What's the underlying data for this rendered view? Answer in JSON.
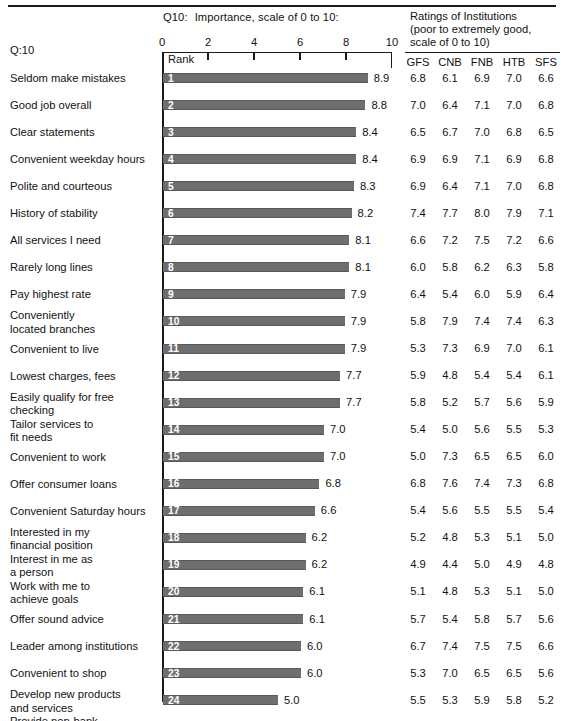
{
  "header": {
    "top_rule": true,
    "q10_prefix": "Q10:",
    "q10_title": "Importance, scale of 0 to 10:",
    "left_label": "Q:10",
    "ratings_line1": "Ratings of Institutions",
    "ratings_line2": "(poor to extremely good,",
    "ratings_line3": "scale of 0 to 10)",
    "rank_header": "Rank"
  },
  "axis": {
    "ticks": [
      0,
      2,
      4,
      6,
      8,
      10
    ],
    "tick_labels": [
      "0",
      "2",
      "4",
      "6",
      "8",
      "10"
    ],
    "min": 0,
    "max": 10
  },
  "ratings_columns": [
    "GFS",
    "CNB",
    "FNB",
    "HTB",
    "SFS"
  ],
  "chart_data": {
    "type": "bar",
    "xlabel": "",
    "ylabel": "",
    "xlim": [
      0,
      10
    ],
    "grid": false,
    "orientation": "horizontal",
    "categories": [
      "Seldom make mistakes",
      "Good job overall",
      "Clear statements",
      "Convenient weekday hours",
      "Polite and courteous",
      "History of stability",
      "All services I need",
      "Rarely long lines",
      "Pay highest rate",
      "Conveniently\n  located branches",
      "Convenient to live",
      "Lowest charges, fees",
      "Easily qualify for free\n  checking",
      "Tailor services to\n  fit needs",
      "Convenient to work",
      "Offer consumer loans",
      "Convenient Saturday hours",
      "Interested in my\n  financial position",
      "Interest in me as\n  a person",
      "Work with me to\n  achieve goals",
      "Offer sound advice",
      "Leader among institutions",
      "Convenient to shop",
      "Develop new products\n  and services",
      "Provide non-bank\n  financial services"
    ],
    "ranks": [
      1,
      2,
      3,
      4,
      5,
      6,
      7,
      8,
      9,
      10,
      11,
      12,
      13,
      14,
      15,
      16,
      17,
      18,
      19,
      20,
      21,
      22,
      23,
      24,
      25
    ],
    "values": [
      8.9,
      8.8,
      8.4,
      8.4,
      8.3,
      8.2,
      8.1,
      8.1,
      7.9,
      7.9,
      7.9,
      7.7,
      7.7,
      7.0,
      7.0,
      6.8,
      6.6,
      6.2,
      6.2,
      6.1,
      6.1,
      6.0,
      6.0,
      5.0,
      3.3
    ],
    "value_labels": [
      "8.9",
      "8.8",
      "8.4",
      "8.4",
      "8.3",
      "8.2",
      "8.1",
      "8.1",
      "7.9",
      "7.9",
      "7.9",
      "7.7",
      "7.7",
      "7.0",
      "7.0",
      "6.8",
      "6.6",
      "6.2",
      "6.2",
      "6.1",
      "6.1",
      "6.0",
      "6.0",
      "5.0",
      "3.3"
    ],
    "ratings_table": {
      "type": "table",
      "columns": [
        "GFS",
        "CNB",
        "FNB",
        "HTB",
        "SFS"
      ],
      "rows": [
        [
          "6.8",
          "6.1",
          "6.9",
          "7.0",
          "6.6"
        ],
        [
          "7.0",
          "6.4",
          "7.1",
          "7.0",
          "6.8"
        ],
        [
          "6.5",
          "6.7",
          "7.0",
          "6.8",
          "6.5"
        ],
        [
          "6.9",
          "6.9",
          "7.1",
          "6.9",
          "6.8"
        ],
        [
          "6.9",
          "6.4",
          "7.1",
          "7.0",
          "6.8"
        ],
        [
          "7.4",
          "7.7",
          "8.0",
          "7.9",
          "7.1"
        ],
        [
          "6.6",
          "7.2",
          "7.5",
          "7.2",
          "6.6"
        ],
        [
          "6.0",
          "5.8",
          "6.2",
          "6.3",
          "5.8"
        ],
        [
          "6.4",
          "5.4",
          "6.0",
          "5.9",
          "6.4"
        ],
        [
          "5.8",
          "7.9",
          "7.4",
          "7.4",
          "6.3"
        ],
        [
          "5.3",
          "7.3",
          "6.9",
          "7.0",
          "6.1"
        ],
        [
          "5.9",
          "4.8",
          "5.4",
          "5.4",
          "6.1"
        ],
        [
          "5.8",
          "5.2",
          "5.7",
          "5.6",
          "5.9"
        ],
        [
          "5.4",
          "5.0",
          "5.6",
          "5.5",
          "5.3"
        ],
        [
          "5.0",
          "7.3",
          "6.5",
          "6.5",
          "6.0"
        ],
        [
          "6.8",
          "7.6",
          "7.4",
          "7.3",
          "6.8"
        ],
        [
          "5.4",
          "5.6",
          "5.5",
          "5.5",
          "5.4"
        ],
        [
          "5.2",
          "4.8",
          "5.3",
          "5.1",
          "5.0"
        ],
        [
          "4.9",
          "4.4",
          "5.0",
          "4.9",
          "4.8"
        ],
        [
          "5.1",
          "4.8",
          "5.3",
          "5.1",
          "5.0"
        ],
        [
          "5.7",
          "5.4",
          "5.8",
          "5.7",
          "5.6"
        ],
        [
          "6.7",
          "7.4",
          "7.5",
          "7.5",
          "6.6"
        ],
        [
          "5.3",
          "7.0",
          "6.5",
          "6.5",
          "5.6"
        ],
        [
          "5.5",
          "5.3",
          "5.9",
          "5.8",
          "5.2"
        ],
        [
          "4.8",
          "5.2",
          "5.1",
          "5.0",
          "4.6"
        ]
      ]
    }
  },
  "style": {
    "bar_color": "#6e6e6e",
    "rule_color": "#1a1a1a",
    "text_color": "#111111",
    "background": "#ffffff"
  }
}
